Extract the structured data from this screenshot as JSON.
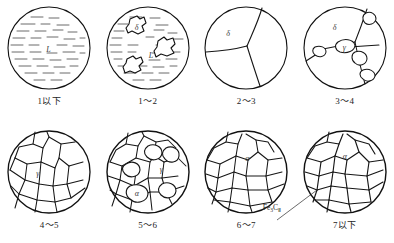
{
  "figure": {
    "colors": {
      "outline": "#111111",
      "grain_boundary": "#161616",
      "liquid_hatch": "#555555",
      "label_text": "#1d1d1d",
      "background": "#ffffff"
    }
  },
  "panels": [
    {
      "id": "panel-1",
      "stage_label": "1以下",
      "phases": [
        {
          "symbol": "L",
          "x": 41,
          "y": 42
        }
      ],
      "description": "fully liquid, hatched"
    },
    {
      "id": "panel-2",
      "stage_label": "1～2",
      "phases": [
        {
          "symbol": "δ",
          "x": 31,
          "y": 22
        },
        {
          "symbol": "L",
          "x": 45,
          "y": 48
        }
      ],
      "description": "liquid with dendritic delta islands"
    },
    {
      "id": "panel-3",
      "stage_label": "2～3",
      "phases": [
        {
          "symbol": "δ",
          "x": 28,
          "y": 28
        }
      ],
      "description": "fully solid delta ferrite, three large grains"
    },
    {
      "id": "panel-4",
      "stage_label": "3～4",
      "phases": [
        {
          "symbol": "δ",
          "x": 34,
          "y": 22
        },
        {
          "symbol": "γ",
          "x": 44,
          "y": 43
        }
      ],
      "description": "austenite nucleating at delta grain boundaries"
    },
    {
      "id": "panel-5",
      "stage_label": "4～5",
      "phases": [
        {
          "symbol": "γ",
          "x": 33,
          "y": 44
        }
      ],
      "description": "fully austenitic polygonal grains"
    },
    {
      "id": "panel-6",
      "stage_label": "5～6",
      "phases": [
        {
          "symbol": "γ",
          "x": 57,
          "y": 39
        },
        {
          "symbol": "α",
          "x": 33,
          "y": 64
        }
      ],
      "description": "ferrite forming within austenite"
    },
    {
      "id": "panel-7",
      "stage_label": "6～7",
      "phases": [
        {
          "symbol": "α",
          "x": 45,
          "y": 29
        }
      ],
      "description": "mostly ferrite, fine grains"
    },
    {
      "id": "panel-8",
      "stage_label": "7以下",
      "phases": [
        {
          "symbol": "α",
          "x": 44,
          "y": 27
        }
      ],
      "annotation": {
        "text_main": "Fe",
        "text_sub": "3",
        "text_tail": "C",
        "text_roman": "Ⅱ"
      },
      "description": "ferrite with secondary cementite on boundaries"
    }
  ]
}
